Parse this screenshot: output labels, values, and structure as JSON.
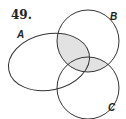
{
  "problem_number": "49.",
  "sets": [
    {
      "label": "A",
      "shape": "ellipse",
      "cx": 49,
      "cy": 62,
      "rx": 41,
      "ry": 28,
      "rotate": -12
    },
    {
      "label": "B",
      "shape": "circle",
      "cx": 88,
      "cy": 41,
      "r": 31
    },
    {
      "label": "C",
      "shape": "circle",
      "cx": 88,
      "cy": 88,
      "r": 31
    }
  ],
  "shaded_region": "B ∩ (A ∪ C)",
  "colors": {
    "stroke": "#333333",
    "shade": "#e2e2e2",
    "background": "#ffffff"
  }
}
